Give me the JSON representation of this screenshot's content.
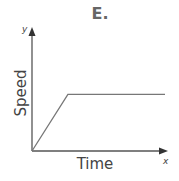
{
  "chart_data": {
    "type": "line",
    "title": "E.",
    "xlabel": "Time",
    "ylabel": "Speed",
    "x_axis_var": "x",
    "y_axis_var": "y",
    "series": [
      {
        "name": "speed",
        "x": [
          0,
          0.27,
          1.0
        ],
        "y": [
          0,
          0.46,
          0.46
        ]
      }
    ],
    "grid": false,
    "legend": null
  }
}
